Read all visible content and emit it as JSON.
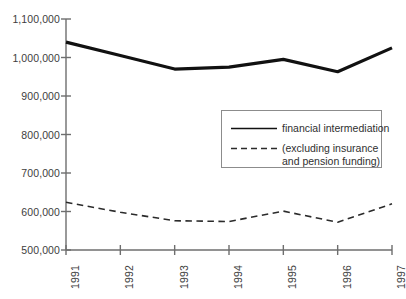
{
  "chart_data": {
    "type": "line",
    "title": "",
    "xlabel": "",
    "ylabel": "",
    "x": [
      "1991",
      "1992",
      "1993",
      "1994",
      "1995",
      "1996",
      "1997"
    ],
    "categories": [
      "1991",
      "1992",
      "1993",
      "1994",
      "1995",
      "1996",
      "1997"
    ],
    "ylim": [
      500000,
      1100000
    ],
    "ytick_labels": [
      "1,100,000",
      "1,000,000",
      "900,000",
      "800,000",
      "700,000",
      "600,000",
      "500,000"
    ],
    "ytick_values": [
      1100000,
      1000000,
      900000,
      800000,
      700000,
      600000,
      500000
    ],
    "grid": false,
    "legend_position": "center-right",
    "series": [
      {
        "name": "financial intermediation",
        "style": "solid",
        "color": "#111111",
        "values": [
          1040000,
          1005000,
          970000,
          975000,
          995000,
          963000,
          1025000
        ]
      },
      {
        "name": "(excluding insurance and pension funding)",
        "style": "dashed",
        "color": "#2b2b2b",
        "values": [
          624000,
          598000,
          576000,
          574000,
          601000,
          572000,
          620000
        ]
      }
    ]
  },
  "legend": {
    "entries": [
      {
        "label": "financial intermediation",
        "style": "solid"
      },
      {
        "label": "(excluding insurance\nand pension funding)",
        "style": "dashed"
      }
    ]
  },
  "axis": {
    "y_labels": [
      "1,100,000",
      "1,000,000",
      "900,000",
      "800,000",
      "700,000",
      "600,000",
      "500,000"
    ],
    "x_labels": [
      "1991",
      "1992",
      "1993",
      "1994",
      "1995",
      "1996",
      "1997"
    ]
  }
}
